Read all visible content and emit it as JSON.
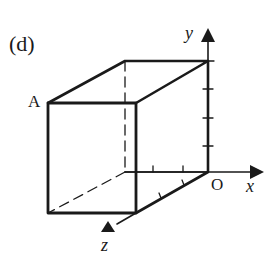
{
  "figure": {
    "panel_label": "(d)",
    "point_labels": {
      "A": "A",
      "origin": "O"
    },
    "axes": {
      "x": "x",
      "y": "y",
      "z": "z"
    },
    "colors": {
      "stroke": "#1a1a1a",
      "background": "#ffffff"
    },
    "tick_marks": {
      "y_axis": 3,
      "x_axis": 2,
      "z_axis": 2
    }
  }
}
